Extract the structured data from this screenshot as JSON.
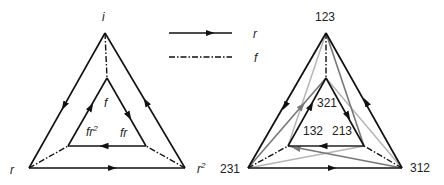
{
  "left_diagram": {
    "vertices": {
      "top": "i",
      "bottom_left": "r",
      "bottom_right": "r",
      "bottom_right_sup": "2",
      "inner_top": "f",
      "inner_left": "fr",
      "inner_left_sup": "2",
      "inner_right": "fr"
    }
  },
  "legend": {
    "items": [
      {
        "style": "solid-arrow",
        "label": "r"
      },
      {
        "style": "dash-dot",
        "label": "f"
      }
    ]
  },
  "right_diagram": {
    "vertices": {
      "top": "123",
      "bottom_left": "231",
      "bottom_right": "312",
      "inner_top": "321",
      "inner_left": "132",
      "inner_right": "213"
    }
  },
  "colors": {
    "black": "#111111",
    "dark_gray": "#777777",
    "light_gray": "#b5b5b5"
  }
}
